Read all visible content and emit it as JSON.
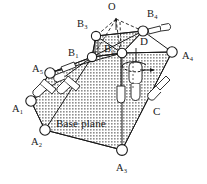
{
  "figure": {
    "background_color": "#ffffff",
    "line_color": "#1a1a1a",
    "base_plane_fill": "#c9c9c9",
    "joint_fill": "#ffffff"
  },
  "labels": {
    "apex": {
      "text": "O",
      "sub": "",
      "x": 110,
      "y": 5
    },
    "base_plane_caption": {
      "text": "Base plane",
      "x": 57,
      "y": 121
    },
    "link_c": {
      "text": "C",
      "x": 155,
      "y": 110
    },
    "link_d": {
      "text": "D",
      "x": 142,
      "y": 39
    }
  },
  "upper_joints": [
    {
      "id": "B1",
      "letter": "B",
      "sub": "1",
      "label_x": 70,
      "label_y": 49,
      "node_x": 92,
      "node_y": 57
    },
    {
      "id": "B2",
      "letter": "B",
      "sub": "2",
      "label_x": 105,
      "label_y": 45,
      "node_x": 122,
      "node_y": 53
    },
    {
      "id": "B3",
      "letter": "B",
      "sub": "3",
      "label_x": 79,
      "label_y": 23,
      "node_x": 96,
      "node_y": 36
    },
    {
      "id": "B4",
      "letter": "B",
      "sub": "4",
      "label_x": 148,
      "label_y": 13,
      "node_x": 143,
      "node_y": 31
    }
  ],
  "base_joints": [
    {
      "id": "A1",
      "letter": "A",
      "sub": "1",
      "label_x": 14,
      "label_y": 108,
      "node_x": 31,
      "node_y": 101
    },
    {
      "id": "A2",
      "letter": "A",
      "sub": "2",
      "label_x": 32,
      "label_y": 141,
      "node_x": 45,
      "node_y": 130
    },
    {
      "id": "A3",
      "letter": "A",
      "sub": "3",
      "label_x": 117,
      "label_y": 166,
      "node_x": 122,
      "node_y": 150
    },
    {
      "id": "A4",
      "letter": "A",
      "sub": "4",
      "label_x": 184,
      "label_y": 55,
      "node_x": 172,
      "node_y": 52
    },
    {
      "id": "A5",
      "letter": "A",
      "sub": "5",
      "label_x": 33,
      "label_y": 68,
      "node_x": 50,
      "node_y": 73
    }
  ],
  "geometry": {
    "base_plane_polygon": "31,101 50,73 92,57 122,53 172,52 122,150 45,130",
    "upper_platform_polygon": "92,57 96,36 143,31 122,53",
    "apex_point": {
      "x": 116,
      "y": 17
    },
    "dashed_from_apex": [
      {
        "to_x": 96,
        "to_y": 36
      },
      {
        "to_x": 143,
        "to_y": 31
      },
      {
        "to_x": 122,
        "to_y": 53
      },
      {
        "to_x": 92,
        "to_y": 57
      }
    ],
    "rotation_arrow": {
      "present": true,
      "cx": 131,
      "cy": 73,
      "direction": "right"
    }
  },
  "actuators": [
    {
      "id": "act-left-outer",
      "x1": 32,
      "y1": 96,
      "x2": 46,
      "y2": 80,
      "label": ""
    },
    {
      "id": "act-left-inner",
      "x1": 60,
      "y1": 93,
      "x2": 72,
      "y2": 78,
      "label": ""
    },
    {
      "id": "act-center",
      "x1": 122,
      "y1": 53,
      "x2": 122,
      "y2": 100,
      "label": ""
    },
    {
      "id": "act-right-c",
      "x1": 152,
      "y1": 98,
      "x2": 164,
      "y2": 84,
      "label": ""
    },
    {
      "id": "act-right-d",
      "x1": 133,
      "y1": 60,
      "x2": 133,
      "y2": 95,
      "label": "D"
    },
    {
      "id": "act-top-right",
      "x1": 150,
      "y1": 33,
      "x2": 166,
      "y2": 35,
      "label": ""
    },
    {
      "id": "act-b1-b3",
      "x1": 95,
      "y1": 38,
      "x2": 95,
      "y2": 56,
      "label": ""
    }
  ]
}
